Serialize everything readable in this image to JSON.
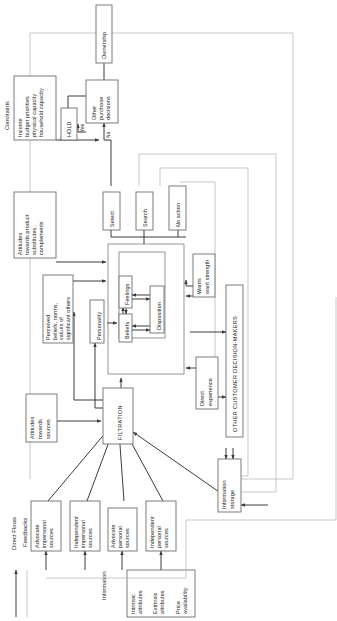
{
  "diagram": {
    "orientation": "rotated-90",
    "legend": {
      "direct_flows_label": "Direct Flows",
      "feedbacks_label": "Feedbacks",
      "direct_flows_color": "#3a3a3a",
      "feedbacks_color": "#b9b9b9"
    },
    "nodes": {
      "ownership": "Ownership",
      "other_purchase_decisions_l1": "Other",
      "other_purchase_decisions_l2": "purchase",
      "other_purchase_decisions_l3": "decisions",
      "hold": "HOLD",
      "yes": "Yes",
      "no": "No",
      "constraints_title": "Constraints",
      "constraints_l1": "Income",
      "constraints_l2": "budget priorities",
      "constraints_l3": "physical capacity",
      "constraints_l4": "household capacity",
      "attitudes_product_l1": "Attitudes",
      "attitudes_product_l2": "towards product",
      "attitudes_product_l3": "substitutes,",
      "attitudes_product_l4": "complements",
      "select": "Select",
      "search": "Search",
      "no_action": "No action",
      "feelings": "Feelings",
      "beliefs": "Beliefs",
      "disposition": "Disposition",
      "wants_l1": "Wants",
      "wants_l2": "want strength",
      "perceived_l1": "Perceived",
      "perceived_l2": "beliefs, norms,",
      "perceived_l3": "values of",
      "perceived_l4": "significant others",
      "personality": "Personality",
      "direct_experience_l1": "Direct",
      "direct_experience_l2": "experience",
      "other_customer_decision_makers": "OTHER CUSTOMER DECISION-MAKERS",
      "attitudes_sources_l1": "Attitudes",
      "attitudes_sources_l2": "towards",
      "attitudes_sources_l3": "sources",
      "filtration": "FILTRATION",
      "advocate_impersonal_l1": "Advocate",
      "advocate_impersonal_l2": "impersonal",
      "advocate_impersonal_l3": "sources",
      "independent_impersonal_l1": "Independent",
      "independent_impersonal_l2": "impersonal",
      "independent_impersonal_l3": "sources",
      "advocate_personal_l1": "Advocate",
      "advocate_personal_l2": "personal",
      "advocate_personal_l3": "sources",
      "independent_personal_l1": "Independent",
      "independent_personal_l2": "personal",
      "independent_personal_l3": "sources",
      "information_storage_l1": "Information",
      "information_storage_l2": "storage",
      "information_label": "Information",
      "intrinsic_attributes_l1": "Intrinsic",
      "intrinsic_attributes_l2": "attributes",
      "extrinsic_attributes_l1": "Extrinsic",
      "extrinsic_attributes_l2": "attributes",
      "price_availability_l1": "Price",
      "price_availability_l2": "availability"
    }
  }
}
